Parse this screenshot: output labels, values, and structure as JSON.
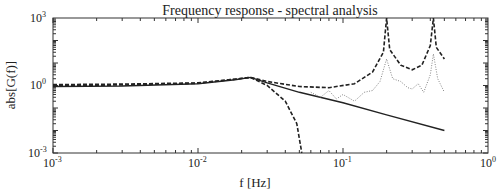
{
  "chart_data": {
    "type": "line",
    "title": "Frequency response - spectral analysis",
    "xlabel": "f [Hz]",
    "ylabel": "abs[G(f)]",
    "xscale": "log",
    "yscale": "log",
    "xlim": [
      0.001,
      1
    ],
    "ylim": [
      0.001,
      1000
    ],
    "grid": false,
    "legend": null,
    "x_ticks": [
      {
        "base": "10",
        "exp": "-3",
        "value": 0.001
      },
      {
        "base": "10",
        "exp": "-2",
        "value": 0.01
      },
      {
        "base": "10",
        "exp": "-1",
        "value": 0.1
      },
      {
        "base": "10",
        "exp": "0",
        "value": 1
      }
    ],
    "y_ticks": [
      {
        "base": "10",
        "exp": "-3",
        "value": 0.001
      },
      {
        "base": "10",
        "exp": "0",
        "value": 1
      },
      {
        "base": "10",
        "exp": "3",
        "value": 1000
      }
    ],
    "series": [
      {
        "name": "model (solid)",
        "style": "solid",
        "x": [
          0.001,
          0.003,
          0.01,
          0.018,
          0.023,
          0.03,
          0.05,
          0.1,
          0.2,
          0.5
        ],
        "y": [
          0.9,
          0.95,
          1.2,
          1.8,
          2.3,
          1.3,
          0.5,
          0.17,
          0.05,
          0.01
        ]
      },
      {
        "name": "model with resonances (dashed)",
        "style": "dashed",
        "x": [
          0.001,
          0.003,
          0.01,
          0.018,
          0.023,
          0.03,
          0.05,
          0.08,
          0.12,
          0.16,
          0.19,
          0.2,
          0.21,
          0.25,
          0.3,
          0.35,
          0.4,
          0.42,
          0.44,
          0.5
        ],
        "y": [
          1.1,
          1.15,
          1.3,
          1.9,
          2.3,
          1.5,
          0.9,
          0.8,
          1.2,
          4,
          30,
          1000,
          40,
          8,
          5,
          8,
          60,
          1000,
          50,
          15
        ]
      },
      {
        "name": "low-pass model (dashed, rolloff)",
        "style": "dashed",
        "x": [
          0.001,
          0.003,
          0.01,
          0.018,
          0.023,
          0.03,
          0.04,
          0.048,
          0.052
        ],
        "y": [
          1.0,
          1.05,
          1.25,
          1.9,
          2.3,
          1.0,
          0.2,
          0.02,
          0.001
        ]
      },
      {
        "name": "spectral estimate (dotted)",
        "style": "dotted",
        "x": [
          0.06,
          0.07,
          0.08,
          0.09,
          0.1,
          0.12,
          0.14,
          0.16,
          0.18,
          0.2,
          0.22,
          0.25,
          0.28,
          0.3,
          0.33,
          0.36,
          0.4,
          0.42,
          0.45,
          0.5
        ],
        "y": [
          0.5,
          0.3,
          0.6,
          0.25,
          0.4,
          0.2,
          0.5,
          0.6,
          1.5,
          15,
          2,
          1.5,
          0.8,
          0.7,
          1.2,
          0.5,
          3,
          25,
          2,
          0.5
        ]
      }
    ]
  }
}
